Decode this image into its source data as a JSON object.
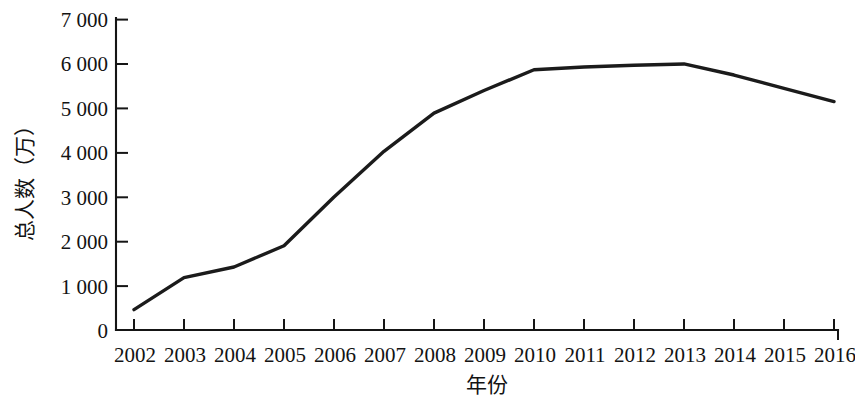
{
  "chart_data": {
    "type": "line",
    "title": "",
    "xlabel": "年份",
    "ylabel": "总人数（万）",
    "categories": [
      "2002",
      "2003",
      "2004",
      "2005",
      "2006",
      "2007",
      "2008",
      "2009",
      "2010",
      "2011",
      "2012",
      "2013",
      "2014",
      "2015",
      "2016"
    ],
    "x": [
      2002,
      2003,
      2004,
      2005,
      2006,
      2007,
      2008,
      2009,
      2010,
      2011,
      2012,
      2013,
      2014,
      2015,
      2016
    ],
    "values": [
      460,
      1180,
      1420,
      1900,
      3000,
      4030,
      4890,
      5400,
      5870,
      5930,
      5970,
      6000,
      5750,
      5450,
      5150
    ],
    "series": [
      {
        "name": "总人数（万）",
        "values": [
          460,
          1180,
          1420,
          1900,
          3000,
          4030,
          4890,
          5400,
          5870,
          5930,
          5970,
          6000,
          5750,
          5450,
          5150
        ]
      }
    ],
    "ylim": [
      0,
      7000
    ],
    "yticks": [
      0,
      1000,
      2000,
      3000,
      4000,
      5000,
      6000,
      7000
    ],
    "ytick_labels": [
      "0",
      "1 000",
      "2 000",
      "3 000",
      "4 000",
      "5 000",
      "6 000",
      "7 000"
    ],
    "grid": false,
    "legend": false,
    "legend_position": "none",
    "line_color": "#1b1b1b",
    "axis_color": "#151515"
  },
  "axes": {
    "y_title": "总人数（万）",
    "x_title": "年份",
    "y_tick_labels": [
      "7 000",
      "6 000",
      "5 000",
      "4 000",
      "3 000",
      "2 000",
      "1 000",
      "0"
    ],
    "x_tick_labels": [
      "2002",
      "2003",
      "2004",
      "2005",
      "2006",
      "2007",
      "2008",
      "2009",
      "2010",
      "2011",
      "2012",
      "2013",
      "2014",
      "2015",
      "2016"
    ]
  }
}
